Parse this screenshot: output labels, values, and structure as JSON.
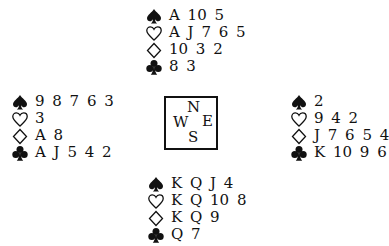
{
  "hands": {
    "north": {
      "spades": "A 10 5",
      "hearts": "A J 7 6 5",
      "diamonds": "10 3 2",
      "clubs": "8 3"
    },
    "west": {
      "spades": "9 8 7 6 3",
      "hearts": "3",
      "diamonds": "A 8",
      "clubs": "A J 5 4 2"
    },
    "east": {
      "spades": "2",
      "hearts": "9 4 2",
      "diamonds": "J 7 6 5 4",
      "clubs": "K 10 9 6"
    },
    "south": {
      "spades": "K Q J 4",
      "hearts": "K Q 10 8",
      "diamonds": "K Q 9",
      "clubs": "Q 7"
    }
  },
  "compass": {
    "north": "N",
    "west": "W",
    "east": "E",
    "south": "S"
  },
  "suit_icons": {
    "spades": "spade-icon (filled)",
    "hearts": "heart-icon (outline)",
    "diamonds": "diamond-icon (outline)",
    "clubs": "club-icon (filled)"
  }
}
